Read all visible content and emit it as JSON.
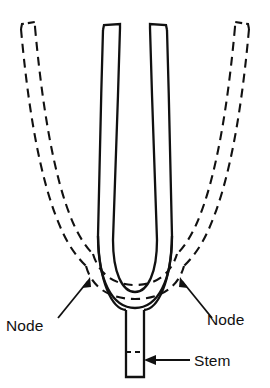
{
  "figure": {
    "kind": "line-diagram",
    "background_color": "#ffffff",
    "stroke_color": "#111111",
    "labels": {
      "node_left": "Node",
      "node_right": "Node",
      "stem": "Stem"
    },
    "legend_meaning": {
      "solid_outline": "tuning fork at rest",
      "dashed_outline": "tuning fork tines deflected outward during vibration"
    },
    "parts": [
      "left-tine-solid",
      "right-tine-solid",
      "left-tine-dashed",
      "right-tine-dashed",
      "u-bend-solid",
      "u-bend-dashed",
      "stem",
      "stem-base-box",
      "node-arrow-left",
      "node-arrow-right",
      "stem-arrow"
    ]
  }
}
